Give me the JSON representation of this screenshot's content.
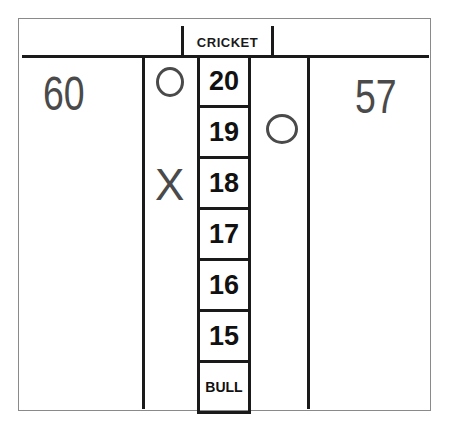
{
  "title": "CRICKET",
  "players": [
    {
      "side": "left",
      "score": "60"
    },
    {
      "side": "right",
      "score": "57"
    }
  ],
  "targets": [
    "20",
    "19",
    "18",
    "17",
    "16",
    "15",
    "BULL"
  ],
  "marks": [
    {
      "player": "left",
      "target": "20",
      "mark": "circle"
    },
    {
      "player": "right",
      "target": "19",
      "mark": "circle"
    },
    {
      "player": "left",
      "target": "18",
      "mark": "X"
    }
  ],
  "colors": {
    "lines": "#1a1a1a",
    "scores": "#4a4a4a",
    "frame": "#8a8a8a"
  }
}
